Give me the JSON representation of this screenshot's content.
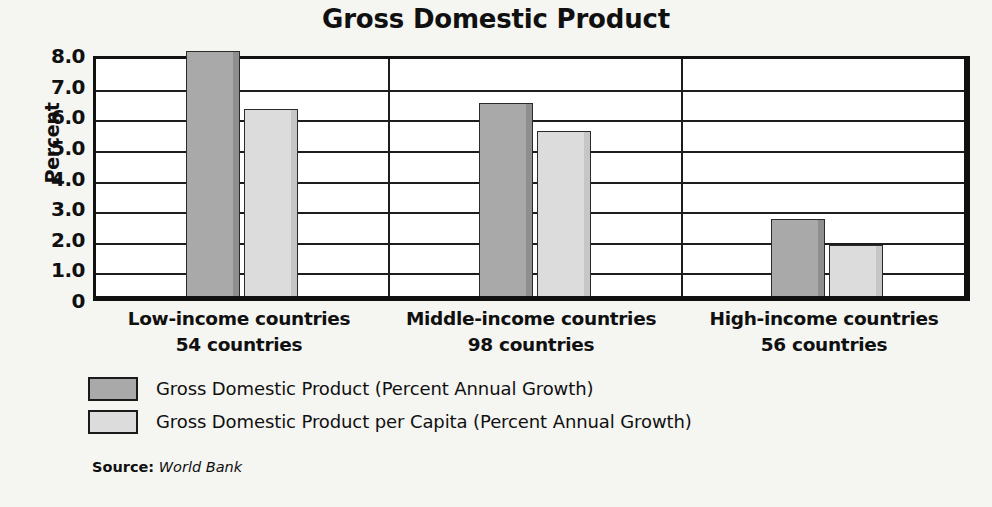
{
  "chart_data": {
    "type": "bar",
    "title": "Gross Domestic Product",
    "xlabel": "",
    "ylabel": "Percent",
    "ylim": [
      0,
      8
    ],
    "ytick_labels": [
      "8.0",
      "7.0",
      "6.0",
      "5.0",
      "4.0",
      "3.0",
      "2.0",
      "1.0",
      "0"
    ],
    "ytick_values": [
      8,
      7,
      6,
      5,
      4,
      3,
      2,
      1,
      0
    ],
    "grid": true,
    "legend_position": "below",
    "categories": [
      "Low-income countries",
      "Middle-income countries",
      "High-income countries"
    ],
    "category_sublabels": [
      "54 countries",
      "98 countries",
      "56 countries"
    ],
    "series": [
      {
        "name": "Gross Domestic Product (Percent Annual Growth)",
        "color": "#a9a9a9",
        "values": [
          8.0,
          6.3,
          2.5
        ]
      },
      {
        "name": "Gross Domestic Product per Capita (Percent Annual Growth)",
        "color": "#dcdcdc",
        "values": [
          6.1,
          5.4,
          1.65
        ]
      }
    ],
    "source_label": "Source:",
    "source_value": "World Bank"
  },
  "title": "Gross Domestic Product",
  "axis": {
    "y_title": "Percent"
  },
  "legend": {
    "items": [
      {
        "label": "Gross Domestic Product (Percent Annual Growth)"
      },
      {
        "label": "Gross Domestic Product per Capita (Percent Annual Growth)"
      }
    ]
  },
  "source": {
    "label": "Source:",
    "value": "World Bank"
  }
}
